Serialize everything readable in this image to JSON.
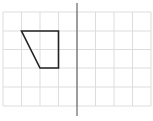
{
  "diagram": {
    "type": "grid-reflection",
    "grid": {
      "columns": 8,
      "rows": 5,
      "x_lines": [
        3,
        21.5,
        40,
        58.5,
        77,
        95.5,
        114,
        132.5,
        151
      ],
      "y_lines": [
        12,
        31,
        49.5,
        68,
        87,
        106
      ],
      "color": "#dddddd"
    },
    "mirror_line": {
      "x": 77,
      "y1": 3,
      "y2": 116,
      "color": "#666666"
    },
    "shape": {
      "name": "trapezoid",
      "points": [
        [
          21.5,
          31
        ],
        [
          58.5,
          31
        ],
        [
          58.5,
          68
        ],
        [
          40,
          68
        ]
      ],
      "stroke": "#222222"
    }
  }
}
